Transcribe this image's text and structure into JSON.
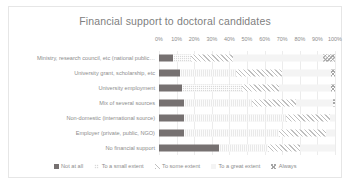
{
  "chart_data": {
    "type": "bar",
    "title": "Financial support to doctoral candidates",
    "subtype": "100% stacked horizontal bar",
    "xlabel": "",
    "ylabel": "",
    "xlim": [
      0,
      100
    ],
    "grid": true,
    "legend_position": "bottom",
    "tick_labels": [
      "0%",
      "10%",
      "20%",
      "30%",
      "40%",
      "50%",
      "60%",
      "70%",
      "80%",
      "90%",
      "100%"
    ],
    "ticks": [
      0,
      10,
      20,
      30,
      40,
      50,
      60,
      70,
      80,
      90,
      100
    ],
    "categories": [
      "Ministry, research council, etc (national public…",
      "University grant, scholarship, etc",
      "University employment",
      "Mix of several sources",
      "Non-domestic (international source)",
      "Employer (private, public, NGO)",
      "No financial support"
    ],
    "series": [
      {
        "name": "Not at all",
        "color": "#767171",
        "pattern": "solid",
        "values": [
          8,
          12,
          13,
          14,
          14,
          14,
          34
        ]
      },
      {
        "name": "To a small extent",
        "color": "#d9d9d9",
        "pattern": "dotted",
        "values": [
          10,
          32,
          34,
          39,
          58,
          54,
          28
        ]
      },
      {
        "name": "To some extent",
        "color": "#bfbfbf",
        "pattern": "diagonal",
        "values": [
          24,
          26,
          21,
          25,
          25,
          27,
          18
        ]
      },
      {
        "name": "To a great extent",
        "color": "#f4f4f4",
        "pattern": "light-solid",
        "values": [
          51,
          28,
          30,
          21,
          3,
          5,
          20
        ]
      },
      {
        "name": "Always",
        "color": "#a6a6a6",
        "pattern": "crosshatch",
        "values": [
          7,
          2,
          2,
          1,
          0,
          0,
          0
        ]
      }
    ]
  }
}
